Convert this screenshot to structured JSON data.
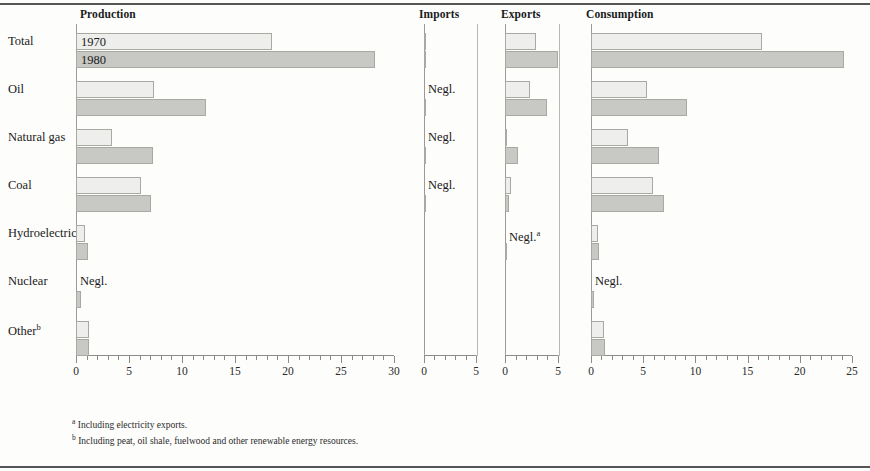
{
  "figure": {
    "series_labels": [
      "1970",
      "1980"
    ],
    "negligible_text": "Negl.",
    "footnotes": [
      {
        "marker": "a",
        "text": "Including electricity exports."
      },
      {
        "marker": "b",
        "text": "Including peat, oil shale, fuelwood and other renewable energy resources."
      }
    ],
    "colors": {
      "bar_1970": "#eeeeec",
      "bar_1980": "#c8c8c4",
      "bar_border": "#a9a9a4",
      "axis": "#8c8c88",
      "text": "#1a1a1a"
    }
  },
  "chart_data": {
    "type": "bar",
    "title": "",
    "orientation": "horizontal",
    "grid": false,
    "legend": "inline-first-row",
    "categories": [
      "Total",
      "Oil",
      "Natural gas",
      "Coal",
      "Hydroelectric",
      "Nuclear",
      "Other"
    ],
    "category_labels": [
      "Total",
      "Oil",
      "Natural gas",
      "Coal",
      "Hydroelectric",
      "Nuclear",
      "Otherᵇ"
    ],
    "panels": [
      {
        "name": "Production",
        "label": "Production",
        "xlabel": "",
        "ylabel": "",
        "xlim": [
          0,
          30
        ],
        "xticks": [
          0,
          5,
          10,
          15,
          20,
          25,
          30
        ],
        "xtick_labels": [
          "0",
          "5",
          "10",
          "15",
          "20",
          "25",
          "30"
        ],
        "minor_tick_step": 1,
        "series": [
          {
            "name": "1970",
            "values": [
              18.5,
              7.4,
              3.4,
              6.1,
              0.85,
              0,
              1.2
            ],
            "notes": [
              "",
              "",
              "",
              "",
              "",
              "Negl.",
              ""
            ]
          },
          {
            "name": "1980",
            "values": [
              28.2,
              12.3,
              7.3,
              7.1,
              1.1,
              0.5,
              1.2
            ],
            "notes": [
              "",
              "",
              "",
              "",
              "",
              "",
              ""
            ]
          }
        ]
      },
      {
        "name": "Imports",
        "label": "Imports",
        "xlabel": "",
        "ylabel": "",
        "xlim": [
          0,
          5
        ],
        "xticks": [
          0,
          5
        ],
        "xtick_labels": [
          "0",
          "5"
        ],
        "minor_tick_step": 1,
        "series": [
          {
            "name": "1970",
            "values": [
              0.12,
              0,
              0,
              0,
              0,
              0,
              0
            ],
            "notes": [
              "",
              "Negl.",
              "Negl.",
              "Negl.",
              "",
              "",
              ""
            ]
          },
          {
            "name": "1980",
            "values": [
              0.14,
              0.05,
              0.05,
              0.05,
              0,
              0,
              0
            ],
            "notes": [
              "",
              "",
              "",
              "",
              "",
              "",
              ""
            ]
          }
        ]
      },
      {
        "name": "Exports",
        "label": "Exports",
        "xlabel": "",
        "ylabel": "",
        "xlim": [
          0,
          5
        ],
        "xticks": [
          0,
          5
        ],
        "xtick_labels": [
          "0",
          "5"
        ],
        "minor_tick_step": 1,
        "series": [
          {
            "name": "1970",
            "values": [
              2.9,
              2.4,
              0.1,
              0.55,
              0,
              0,
              0
            ],
            "notes": [
              "",
              "",
              "",
              "",
              "Negl.ᵃ",
              "",
              ""
            ]
          },
          {
            "name": "1980",
            "values": [
              5.0,
              4.0,
              1.25,
              0.35,
              0.12,
              0,
              0
            ],
            "notes": [
              "",
              "",
              "",
              "",
              "",
              "",
              ""
            ]
          }
        ]
      },
      {
        "name": "Consumption",
        "label": "Consumption",
        "xlabel": "",
        "ylabel": "",
        "xlim": [
          0,
          25
        ],
        "xticks": [
          0,
          5,
          10,
          15,
          20,
          25
        ],
        "xtick_labels": [
          "0",
          "5",
          "10",
          "15",
          "20",
          "25"
        ],
        "minor_tick_step": 1,
        "series": [
          {
            "name": "1970",
            "values": [
              16.4,
              5.4,
              3.5,
              5.9,
              0.7,
              0,
              1.2
            ],
            "notes": [
              "",
              "",
              "",
              "",
              "",
              "Negl.",
              ""
            ]
          },
          {
            "name": "1980",
            "values": [
              24.2,
              9.2,
              6.5,
              7.0,
              0.8,
              0.3,
              1.3
            ],
            "notes": [
              "",
              "",
              "",
              "",
              "",
              "",
              ""
            ]
          }
        ]
      }
    ]
  }
}
